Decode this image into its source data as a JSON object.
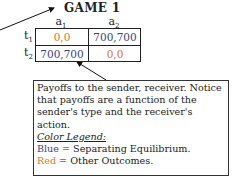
{
  "title": "GAME 1",
  "columns": [
    {
      "label": "a",
      "sub": "1"
    },
    {
      "label": "a",
      "sub": "2"
    }
  ],
  "rows": [
    {
      "label": "t",
      "sub": "1",
      "cells": [
        {
          "value": "0,0",
          "color": "#d9772f"
        },
        {
          "value": "700,700",
          "color": "#3b3f7a"
        }
      ]
    },
    {
      "label": "t",
      "sub": "2",
      "cells": [
        {
          "value": "700,700",
          "color": "#3b3f7a"
        },
        {
          "value": "0,0",
          "color": "#d9772f"
        }
      ]
    }
  ],
  "note": {
    "lines": [
      "Payoffs to the sender, receiver. Notice",
      "that payoffs are a function of the",
      "sender's type and the receiver's action."
    ],
    "legend_title": "Color Legend:",
    "legend": [
      {
        "color_word": "Blue",
        "text": " = Separating Equilibrium.",
        "color": "#3b3f7a"
      },
      {
        "color_word": "Red",
        "text": " = Other Outcomes.",
        "color": "#d9772f"
      }
    ]
  }
}
